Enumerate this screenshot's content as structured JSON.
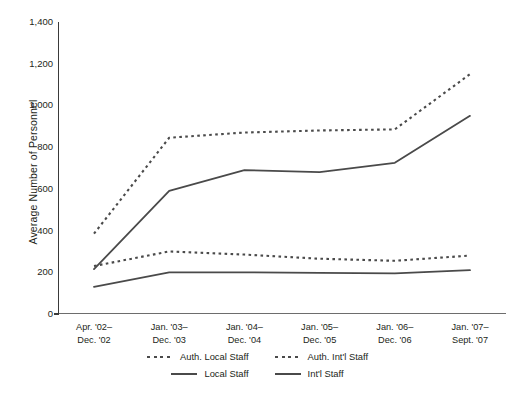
{
  "chart_data": {
    "type": "line",
    "title": "",
    "xlabel": "",
    "ylabel": "Average Number of Personnel",
    "categories": [
      "Apr. '02–|Dec. '02",
      "Jan. '03–|Dec. '03",
      "Jan. '04–|Dec. '04",
      "Jan. '05–|Dec. '05",
      "Jan. '06–|Dec. '06",
      "Jan. '07–|Sept. '07"
    ],
    "ylim": [
      0,
      1400
    ],
    "yticks": [
      0,
      200,
      400,
      600,
      800,
      1000,
      1200,
      1400
    ],
    "ytick_labels": [
      "0",
      "200",
      "400",
      "600",
      "800",
      "1,000",
      "1,200",
      "1,400"
    ],
    "grid": false,
    "legend_position": "below",
    "series": [
      {
        "name": "Auth. Local Staff",
        "style": "dashed",
        "color": "#4a4a4a",
        "values": [
          385,
          845,
          870,
          880,
          885,
          1150
        ]
      },
      {
        "name": "Auth. Int'l Staff",
        "style": "dashed",
        "color": "#4a4a4a",
        "values": [
          230,
          300,
          285,
          265,
          255,
          280
        ]
      },
      {
        "name": "Local Staff",
        "style": "solid",
        "color": "#4a4a4a",
        "values": [
          215,
          590,
          690,
          680,
          725,
          950
        ]
      },
      {
        "name": "Int'l Staff",
        "style": "solid",
        "color": "#4a4a4a",
        "values": [
          130,
          200,
          200,
          197,
          195,
          210
        ]
      }
    ]
  },
  "legend": {
    "row1": [
      {
        "label": "Auth. Local Staff",
        "style": "dashed"
      },
      {
        "label": "Auth. Int'l  Staff",
        "style": "dashed"
      }
    ],
    "row2": [
      {
        "label": "Local Staff",
        "style": "solid"
      },
      {
        "label": "Int'l Staff",
        "style": "solid"
      }
    ]
  }
}
